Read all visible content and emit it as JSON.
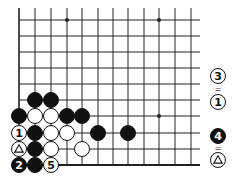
{
  "board": {
    "cols_x": [
      19,
      35,
      51,
      67,
      82,
      98,
      113,
      128,
      144,
      159,
      175,
      191
    ],
    "rows_y": [
      20,
      36,
      52,
      68,
      84,
      100,
      116,
      133,
      149,
      165
    ],
    "right_edge_x": 200,
    "stone_radius": 7.5,
    "star_points": [
      {
        "c": 3,
        "r": 0
      },
      {
        "c": 9,
        "r": 0
      },
      {
        "c": 9,
        "r": 6
      }
    ],
    "colors": {
      "line": "#222222",
      "black": "#111111",
      "white": "#ffffff"
    }
  },
  "stones": [
    {
      "c": 1,
      "r": 5,
      "color": "black",
      "label": ""
    },
    {
      "c": 2,
      "r": 5,
      "color": "black",
      "label": ""
    },
    {
      "c": 0,
      "r": 6,
      "color": "black",
      "label": ""
    },
    {
      "c": 1,
      "r": 6,
      "color": "white",
      "label": ""
    },
    {
      "c": 2,
      "r": 6,
      "color": "white",
      "label": ""
    },
    {
      "c": 3,
      "r": 6,
      "color": "black",
      "label": ""
    },
    {
      "c": 4,
      "r": 6,
      "color": "black",
      "label": ""
    },
    {
      "c": 0,
      "r": 7,
      "color": "white",
      "label": "1"
    },
    {
      "c": 1,
      "r": 7,
      "color": "black",
      "label": ""
    },
    {
      "c": 2,
      "r": 7,
      "color": "white",
      "label": ""
    },
    {
      "c": 3,
      "r": 7,
      "color": "white",
      "label": ""
    },
    {
      "c": 5,
      "r": 7,
      "color": "black",
      "label": ""
    },
    {
      "c": 7,
      "r": 7,
      "color": "black",
      "label": ""
    },
    {
      "c": 0,
      "r": 8,
      "color": "white",
      "label": "triangle"
    },
    {
      "c": 1,
      "r": 8,
      "color": "black",
      "label": ""
    },
    {
      "c": 2,
      "r": 8,
      "color": "white",
      "label": ""
    },
    {
      "c": 4,
      "r": 8,
      "color": "white",
      "label": ""
    },
    {
      "c": 0,
      "r": 9,
      "color": "black",
      "label": "2"
    },
    {
      "c": 1,
      "r": 9,
      "color": "black",
      "label": ""
    },
    {
      "c": 2,
      "r": 9,
      "color": "white",
      "label": "5"
    }
  ],
  "annotations": [
    {
      "y": 76,
      "color": "white",
      "label": "3"
    },
    {
      "y": 89,
      "eq": "="
    },
    {
      "y": 102,
      "color": "white",
      "label": "1"
    },
    {
      "y": 136,
      "color": "black",
      "label": "4"
    },
    {
      "y": 148,
      "eq": "="
    },
    {
      "y": 160,
      "color": "white",
      "label": "triangle"
    }
  ],
  "annotation_x": 218
}
